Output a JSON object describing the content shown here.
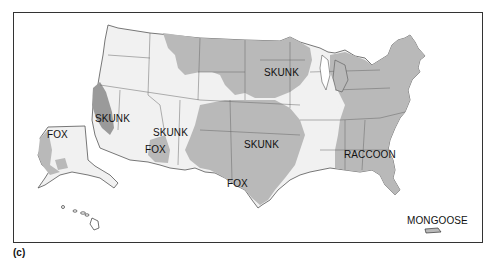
{
  "figure": {
    "panel_label": "(c)"
  },
  "colors": {
    "background": "#ffffff",
    "state_fill_light": "#f1f1f1",
    "reservoir_fill_mid": "#b9b9b9",
    "reservoir_fill_dark": "#9a9a9a",
    "state_border": "#555555",
    "text": "#111111"
  },
  "legend_regions": [
    {
      "id": "skunk-north-central",
      "label": "SKUNK"
    },
    {
      "id": "skunk-california",
      "label": "SKUNK"
    },
    {
      "id": "fox-alaska",
      "label": "FOX"
    },
    {
      "id": "skunk-southwest",
      "label": "SKUNK"
    },
    {
      "id": "fox-arizona",
      "label": "FOX"
    },
    {
      "id": "skunk-south-central",
      "label": "SKUNK"
    },
    {
      "id": "raccoon-east",
      "label": "RACCOON"
    },
    {
      "id": "fox-texas",
      "label": "FOX"
    },
    {
      "id": "mongoose-puerto-rico",
      "label": "MONGOOSE"
    }
  ]
}
